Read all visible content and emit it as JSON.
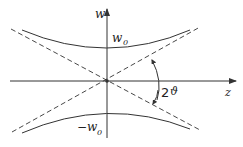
{
  "diagram": {
    "axes": {
      "vertical_label": "w",
      "horizontal_label": "z"
    },
    "labels": {
      "waist_upper": "w",
      "waist_upper_sub": "0",
      "waist_lower": "−w",
      "waist_lower_sub": "0",
      "angle_prefix": "2",
      "angle_symbol": "ϑ"
    },
    "colors": {
      "line": "#333333",
      "background": "#ffffff"
    }
  }
}
